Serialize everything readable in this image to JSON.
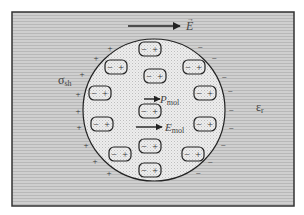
{
  "diagram": {
    "colors": {
      "outer_bg": "#c9c9c9",
      "stripe": "#b4b4b4",
      "sphere_bg": "#ececec",
      "stroke": "#222222",
      "page": "#ffffff"
    },
    "labels": {
      "external_field": "E",
      "p_mol": "P",
      "p_mol_sub": "mol",
      "e_mol": "E",
      "e_mol_sub": "mol",
      "sigma": "σ",
      "sigma_sub": "sh",
      "epsilon": "ε",
      "epsilon_sub": "r"
    },
    "dipole_symbols": {
      "neg": "−",
      "pos": "+"
    },
    "dipoles": [
      {
        "x": 150,
        "y": 49
      },
      {
        "x": 116,
        "y": 67
      },
      {
        "x": 155,
        "y": 76
      },
      {
        "x": 194,
        "y": 67
      },
      {
        "x": 100,
        "y": 93
      },
      {
        "x": 205,
        "y": 93
      },
      {
        "x": 150,
        "y": 111
      },
      {
        "x": 102,
        "y": 124
      },
      {
        "x": 205,
        "y": 124
      },
      {
        "x": 150,
        "y": 146
      },
      {
        "x": 120,
        "y": 154
      },
      {
        "x": 193,
        "y": 154
      },
      {
        "x": 150,
        "y": 170
      }
    ],
    "surface_plus": [
      {
        "x": 110,
        "y": 48
      },
      {
        "x": 96,
        "y": 58
      },
      {
        "x": 82,
        "y": 74
      },
      {
        "x": 78,
        "y": 94
      },
      {
        "x": 78,
        "y": 111
      },
      {
        "x": 79,
        "y": 127
      },
      {
        "x": 86,
        "y": 145
      },
      {
        "x": 95,
        "y": 161
      },
      {
        "x": 109,
        "y": 173
      }
    ],
    "surface_minus": [
      {
        "x": 200,
        "y": 47
      },
      {
        "x": 214,
        "y": 58
      },
      {
        "x": 224,
        "y": 77
      },
      {
        "x": 230,
        "y": 91
      },
      {
        "x": 231,
        "y": 110
      },
      {
        "x": 231,
        "y": 128
      },
      {
        "x": 223,
        "y": 145
      },
      {
        "x": 210,
        "y": 162
      },
      {
        "x": 198,
        "y": 173
      }
    ]
  }
}
